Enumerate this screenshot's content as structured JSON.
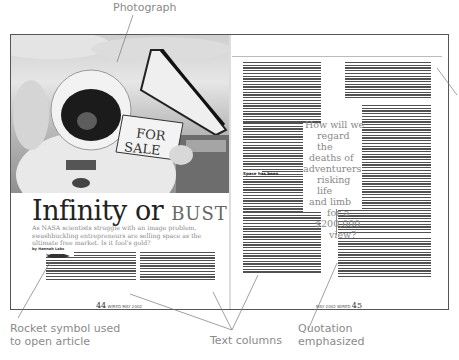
{
  "annotations": {
    "photograph": "Photograph",
    "rocket_line1": "Rocket symbol used",
    "rocket_line2": "to open article",
    "text_columns": "Text columns",
    "quotation_line1": "Quotation",
    "quotation_line2": "emphasized"
  },
  "spread": {
    "photo": {
      "subject": "astronaut holding sign",
      "sign_text_1": "FOR",
      "sign_text_2": "SALE"
    },
    "left_page": {
      "headline_main": "Infinity or ",
      "headline_accent": "BUST",
      "deck": "As NASA scientists struggle with an image problem, swashbuckling entrepreneurs are selling space as the ultimate free market. Is it fool's gold?",
      "byline": "by Hannah Laks",
      "rocket_icon": "rocket",
      "folio_page": "44",
      "folio_text": "WIRED  MAY 2002 "
    },
    "right_page": {
      "pull_quote": "How will we regard the deaths of adventurers risking life and limb for a $200,000 view?",
      "pull_quote_lines": [
        "How will we",
        "regard the",
        "deaths of",
        "adventurers",
        "risking life",
        "and limb",
        "for a",
        "$200,000",
        "view?"
      ],
      "subhead": "Space has been",
      "folio_page": "45",
      "folio_text": "MAY 2002  WIRED "
    }
  },
  "colors": {
    "annotation_text": "#8a8a8a",
    "leader_line": "#777777",
    "border": "#555555"
  }
}
